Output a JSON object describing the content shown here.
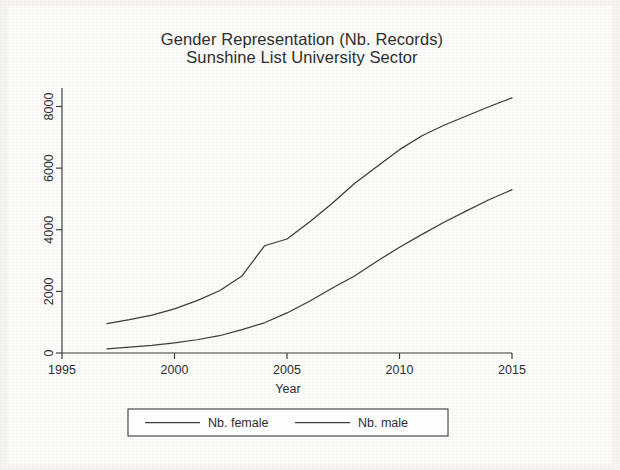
{
  "chart_data": {
    "type": "line",
    "title": "Gender Representation (Nb. Records)",
    "subtitle": "Sunshine List University Sector",
    "xlabel": "Year",
    "ylabel": "",
    "xlim": [
      1995,
      2015
    ],
    "ylim": [
      0,
      8600
    ],
    "xticks": [
      1995,
      2000,
      2005,
      2010,
      2015
    ],
    "xticklabels": [
      "1995",
      "2000",
      "2005",
      "2010",
      "2015"
    ],
    "yticks": [
      0,
      2000,
      4000,
      6000,
      8000
    ],
    "yticklabels": [
      "0",
      "2000",
      "4000",
      "6000",
      "8000"
    ],
    "grid": false,
    "legend_position": "bottom",
    "x": [
      1997,
      1998,
      1999,
      2000,
      2001,
      2002,
      2003,
      2004,
      2005,
      2006,
      2007,
      2008,
      2009,
      2010,
      2011,
      2012,
      2013,
      2014,
      2015
    ],
    "series": [
      {
        "name": "Nb. male",
        "color": "#3d3d3d",
        "values": [
          950,
          1080,
          1230,
          1430,
          1700,
          2020,
          2500,
          3480,
          3700,
          4250,
          4850,
          5500,
          6050,
          6600,
          7050,
          7400,
          7700,
          8000,
          8280
        ]
      },
      {
        "name": "Nb. female",
        "color": "#3d3d3d",
        "values": [
          130,
          190,
          250,
          330,
          430,
          560,
          760,
          980,
          1300,
          1680,
          2100,
          2500,
          2980,
          3430,
          3850,
          4250,
          4620,
          4980,
          5300
        ]
      }
    ]
  },
  "legend": {
    "items": [
      {
        "label": "Nb. female"
      },
      {
        "label": "Nb. male"
      }
    ]
  },
  "axes": {
    "x_title": "Year",
    "y_title": ""
  }
}
